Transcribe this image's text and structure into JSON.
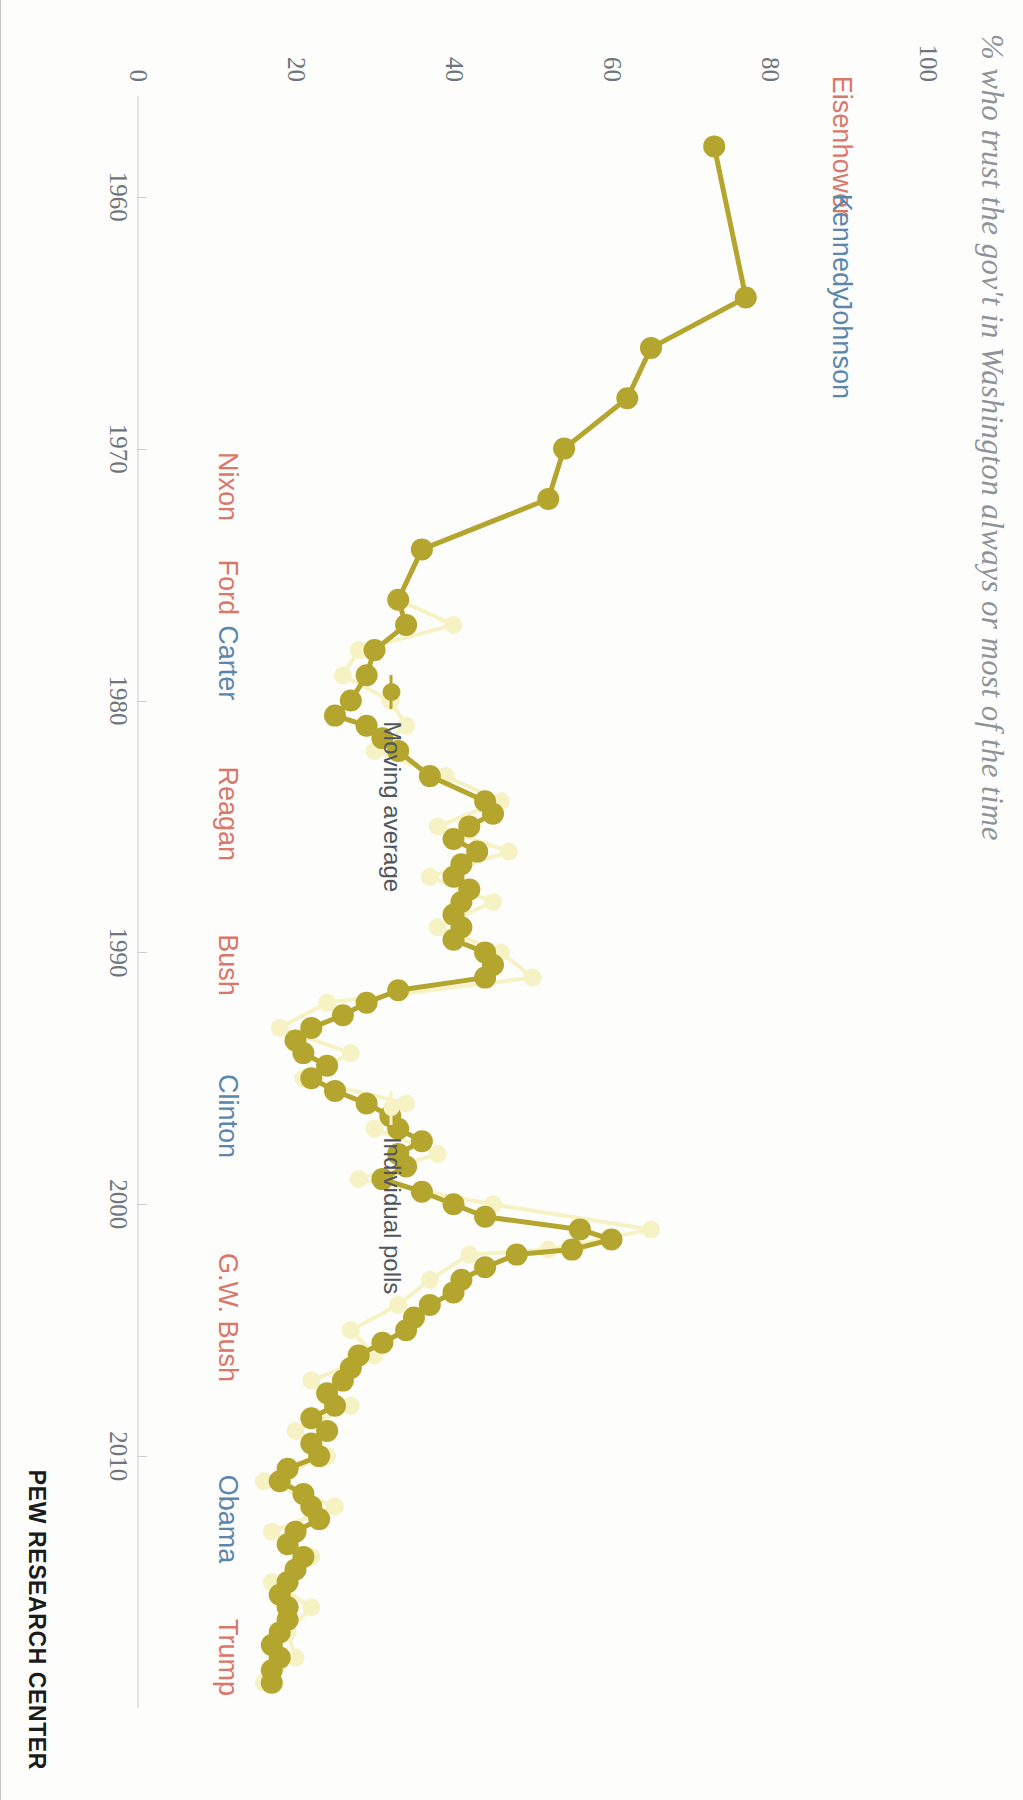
{
  "title": "% who trust the gov't in Washington always or most of the time",
  "brand": "PEW RESEARCH CENTER",
  "legend": [
    {
      "key": "moving-average",
      "label": "Moving average",
      "color": "#b4a52f"
    },
    {
      "key": "individual-polls",
      "label": "Individual polls",
      "color": "#f6f2c4"
    }
  ],
  "colors": {
    "republican": "#d9776a",
    "democrat": "#5c87ad",
    "moving_average": "#b4a52f",
    "individual_polls": "#f6f2c4",
    "axis": "#c9ccd0",
    "title": "#8e9399",
    "tick_text": "#6f757c"
  },
  "presidents": [
    {
      "name": "Eisenhower",
      "party": "rep",
      "side": "left",
      "year": 1958.0
    },
    {
      "name": "Kennedy",
      "party": "dem",
      "side": "left",
      "year": 1962.0
    },
    {
      "name": "Johnson",
      "party": "dem",
      "side": "left",
      "year": 1966.0
    },
    {
      "name": "Nixon",
      "party": "rep",
      "side": "right",
      "year": 1971.5
    },
    {
      "name": "Ford",
      "party": "rep",
      "side": "right",
      "year": 1975.5
    },
    {
      "name": "Carter",
      "party": "dem",
      "side": "right",
      "year": 1978.5
    },
    {
      "name": "Reagan",
      "party": "rep",
      "side": "right",
      "year": 1984.5
    },
    {
      "name": "Bush",
      "party": "rep",
      "side": "right",
      "year": 1990.5
    },
    {
      "name": "Clinton",
      "party": "dem",
      "side": "right",
      "year": 1996.5
    },
    {
      "name": "G.W. Bush",
      "party": "rep",
      "side": "right",
      "year": 2004.5
    },
    {
      "name": "Obama",
      "party": "dem",
      "side": "right",
      "year": 2012.5
    },
    {
      "name": "Trump",
      "party": "rep",
      "side": "right",
      "year": 2018.0
    }
  ],
  "chart_data": {
    "type": "line",
    "title": "% who trust the gov't in Washington always or most of the time",
    "xlabel": "",
    "ylabel": "",
    "xlim": [
      1956,
      2020
    ],
    "ylim": [
      0,
      100
    ],
    "xticks": [
      1960,
      1970,
      1980,
      1990,
      2000,
      2010
    ],
    "xtick_labels": [
      "1960",
      "1970",
      "1980",
      "1990",
      "2000",
      "2010"
    ],
    "yticks": [
      0,
      20,
      40,
      60,
      80,
      100
    ],
    "ytick_labels": [
      "0",
      "20",
      "40",
      "60",
      "80",
      "100"
    ],
    "grid": false,
    "legend_position": "left-inside",
    "series": [
      {
        "name": "Moving average",
        "color": "#b4a52f",
        "marker": "circle",
        "x": [
          1958,
          1964,
          1966,
          1968,
          1970,
          1972,
          1974,
          1976,
          1977,
          1978,
          1979,
          1980,
          1980.6,
          1981,
          1981.5,
          1982,
          1983,
          1984,
          1984.5,
          1985,
          1985.5,
          1986,
          1986.5,
          1987,
          1987.5,
          1988,
          1988.5,
          1989,
          1989.5,
          1990,
          1990.5,
          1991,
          1991.5,
          1992,
          1992.5,
          1993,
          1993.5,
          1994,
          1994.5,
          1995,
          1995.5,
          1996,
          1996.5,
          1997,
          1997.5,
          1998,
          1998.5,
          1999,
          1999.5,
          2000,
          2000.5,
          2001,
          2001.4,
          2001.8,
          2002,
          2002.5,
          2003,
          2003.5,
          2004,
          2004.5,
          2005,
          2005.5,
          2006,
          2006.5,
          2007,
          2007.5,
          2008,
          2008.5,
          2009,
          2009.5,
          2010,
          2010.5,
          2011,
          2011.5,
          2012,
          2012.5,
          2013,
          2013.5,
          2014,
          2014.5,
          2015,
          2015.5,
          2016,
          2016.5,
          2017,
          2017.5,
          2018,
          2018.5,
          2019
        ],
        "y": [
          73,
          77,
          65,
          62,
          54,
          52,
          36,
          33,
          34,
          30,
          29,
          27,
          25,
          29,
          31,
          33,
          37,
          44,
          45,
          42,
          40,
          43,
          41,
          40,
          42,
          41,
          40,
          41,
          40,
          44,
          45,
          44,
          33,
          29,
          26,
          22,
          20,
          21,
          24,
          22,
          25,
          29,
          32,
          33,
          36,
          33,
          34,
          31,
          36,
          40,
          44,
          56,
          60,
          55,
          48,
          44,
          41,
          40,
          37,
          35,
          34,
          31,
          28,
          27,
          26,
          24,
          25,
          22,
          24,
          22,
          23,
          19,
          18,
          21,
          22,
          23,
          20,
          19,
          21,
          20,
          19,
          18,
          19,
          19,
          18,
          17,
          18,
          17,
          17
        ]
      },
      {
        "name": "Individual polls",
        "color": "#f6f2c4",
        "marker": "circle",
        "x": [
          1958,
          1964,
          1966,
          1968,
          1970,
          1972,
          1974,
          1976,
          1977,
          1978,
          1979,
          1980,
          1981,
          1982,
          1983,
          1984,
          1985,
          1986,
          1987,
          1988,
          1989,
          1990,
          1991,
          1992,
          1993,
          1994,
          1995,
          1996,
          1997,
          1998,
          1999,
          2000,
          2001,
          2001.8,
          2002,
          2003,
          2004,
          2005,
          2006,
          2007,
          2008,
          2009,
          2010,
          2011,
          2012,
          2013,
          2014,
          2015,
          2016,
          2017,
          2018,
          2019
        ],
        "y": [
          73,
          77,
          65,
          62,
          54,
          52,
          36,
          33,
          40,
          28,
          26,
          32,
          34,
          30,
          39,
          46,
          38,
          47,
          37,
          45,
          38,
          46,
          50,
          24,
          18,
          27,
          21,
          34,
          30,
          38,
          28,
          45,
          65,
          52,
          42,
          37,
          33,
          27,
          30,
          22,
          27,
          20,
          24,
          16,
          25,
          17,
          22,
          17,
          22,
          19,
          20,
          16
        ]
      }
    ]
  }
}
